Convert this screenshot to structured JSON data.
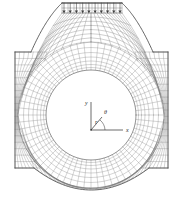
{
  "figure": {
    "background_color": "#ffffff",
    "line_color": "#6f6f6f",
    "bold_line_color": "#3d3d3d",
    "label_color": "#2b2b2b",
    "width_px": 183,
    "height_px": 214
  },
  "annotations": {
    "axis_y_label": "y",
    "axis_x_label": "x",
    "axis_theta_label": "θ",
    "axis_r_label": "r",
    "origin_label": "o"
  },
  "chart_data": {
    "type": "diagram",
    "subtype": "finite-element-mesh",
    "grid": false,
    "legend": null,
    "xlabel": "x",
    "ylabel": "y",
    "coordinate_systems": [
      {
        "name": "cartesian",
        "origin": [
          91,
          130
        ],
        "axes": [
          {
            "label": "y",
            "direction": "up",
            "length_px": 28
          },
          {
            "label": "x",
            "direction": "right",
            "length_px": 32
          }
        ]
      },
      {
        "name": "polar",
        "origin": [
          91,
          130
        ],
        "axes": [
          {
            "label": "r",
            "direction": "up-right",
            "angle_deg": 50,
            "length_px": 17
          },
          {
            "label": "θ",
            "description": "angle arc from x-axis to r"
          }
        ]
      }
    ],
    "hole": {
      "shape": "circle",
      "center": [
        91,
        115
      ],
      "radius": 45,
      "ring_radii": [
        45,
        47.5,
        50.5,
        54,
        58,
        62.5,
        67.5,
        73
      ],
      "angular_divisions": 64
    },
    "loading": {
      "type": "distributed-pressure",
      "edge": "top",
      "direction": "downward",
      "arrow_count": 10,
      "x_start": 62,
      "x_end": 122,
      "y_tail": 3,
      "y_head": 13
    },
    "mesh_regions": [
      {
        "name": "top-load-band",
        "rows": 2,
        "cols": 10
      },
      {
        "name": "upper-funnel-left",
        "description": "graded quadrilateral mesh fanning from top band to left shoulder"
      },
      {
        "name": "upper-funnel-right",
        "description": "graded quadrilateral mesh fanning from top band to right shoulder"
      },
      {
        "name": "left-flange",
        "rows": 18,
        "cols": 7
      },
      {
        "name": "right-flange",
        "rows": 18,
        "cols": 7
      },
      {
        "name": "hole-ring",
        "rings": 7,
        "sectors": 64
      },
      {
        "name": "bottom-arc-band",
        "rows": 4,
        "description": "curved band following lower boundary"
      }
    ],
    "outline_vertices": [
      [
        62,
        3
      ],
      [
        122,
        3
      ],
      [
        128,
        14
      ],
      [
        140,
        40
      ],
      [
        152,
        52
      ],
      [
        168,
        52
      ],
      [
        168,
        168
      ],
      [
        150,
        168
      ],
      [
        132,
        180
      ],
      [
        112,
        196
      ],
      [
        91,
        200
      ],
      [
        70,
        196
      ],
      [
        50,
        180
      ],
      [
        33,
        168
      ],
      [
        15,
        168
      ],
      [
        15,
        52
      ],
      [
        31,
        52
      ],
      [
        43,
        40
      ],
      [
        55,
        14
      ]
    ]
  }
}
